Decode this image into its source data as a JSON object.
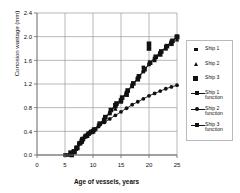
{
  "chart_data": {
    "type": "scatter",
    "title": "",
    "xlabel": "Age of vessels, years",
    "ylabel": "Corrosion wastage (mm)",
    "xlim": [
      0,
      25
    ],
    "ylim": [
      0.0,
      2.4
    ],
    "xticks": [
      "0",
      "5",
      "10",
      "15",
      "20",
      "25"
    ],
    "yticks": [
      "0.0",
      "0.4",
      "0.8",
      "1.2",
      "1.6",
      "2.0",
      "2.4"
    ],
    "grid": true,
    "legend_position": "right",
    "series": [
      {
        "name": "Ship 1",
        "marker": "diamond",
        "type": "scatter",
        "points": [
          [
            5.0,
            0.0
          ],
          [
            6.5,
            0.05
          ],
          [
            7.0,
            0.12
          ],
          [
            7.5,
            0.2
          ],
          [
            8.0,
            0.27
          ],
          [
            9.0,
            0.33
          ],
          [
            9.5,
            0.38
          ],
          [
            10.0,
            0.41
          ],
          [
            10.5,
            0.44
          ],
          [
            12.0,
            0.6
          ],
          [
            13.0,
            0.7
          ],
          [
            14.0,
            0.82
          ],
          [
            15.0,
            0.92
          ],
          [
            16.0,
            1.06
          ],
          [
            17.0,
            1.18
          ],
          [
            18.0,
            1.3
          ],
          [
            19.0,
            1.48
          ],
          [
            20.0,
            1.81
          ],
          [
            21.0,
            1.62
          ],
          [
            22.0,
            1.72
          ],
          [
            23.0,
            1.8
          ],
          [
            24.0,
            1.9
          ],
          [
            25.0,
            2.0
          ]
        ]
      },
      {
        "name": "Ship 2",
        "marker": "triangle",
        "type": "scatter",
        "points": [
          [
            6.0,
            0.02
          ],
          [
            7.0,
            0.1
          ],
          [
            8.0,
            0.22
          ],
          [
            9.0,
            0.32
          ],
          [
            10.0,
            0.4
          ],
          [
            12.0,
            0.56
          ],
          [
            14.0,
            0.78
          ],
          [
            15.0,
            0.9
          ],
          [
            17.0,
            1.16
          ],
          [
            19.0,
            1.44
          ],
          [
            21.0,
            1.6
          ],
          [
            23.0,
            1.8
          ],
          [
            25.0,
            1.95
          ]
        ]
      },
      {
        "name": "Ship 3",
        "marker": "square",
        "type": "scatter",
        "points": [
          [
            6.0,
            0.04
          ],
          [
            8.0,
            0.24
          ],
          [
            10.0,
            0.4
          ],
          [
            12.0,
            0.58
          ],
          [
            14.0,
            0.84
          ],
          [
            15.0,
            0.92
          ],
          [
            16.0,
            1.02
          ],
          [
            18.0,
            1.28
          ],
          [
            20.0,
            1.88
          ],
          [
            20.0,
            1.8
          ],
          [
            22.0,
            1.7
          ],
          [
            24.0,
            1.88
          ],
          [
            25.0,
            2.0
          ]
        ]
      },
      {
        "name": "Ship 1 function",
        "marker": "diamond-line",
        "type": "line",
        "points": [
          [
            5.5,
            0.0
          ],
          [
            6.0,
            0.03
          ],
          [
            6.5,
            0.07
          ],
          [
            7.0,
            0.13
          ],
          [
            7.5,
            0.19
          ],
          [
            8.0,
            0.25
          ],
          [
            8.5,
            0.3
          ],
          [
            9.0,
            0.34
          ],
          [
            9.5,
            0.38
          ],
          [
            10.0,
            0.41
          ],
          [
            11.0,
            0.5
          ],
          [
            12.0,
            0.6
          ],
          [
            13.0,
            0.71
          ],
          [
            14.0,
            0.82
          ],
          [
            15.0,
            0.93
          ],
          [
            16.0,
            1.05
          ],
          [
            17.0,
            1.17
          ],
          [
            18.0,
            1.29
          ],
          [
            19.0,
            1.41
          ],
          [
            20.0,
            1.53
          ],
          [
            21.0,
            1.63
          ],
          [
            22.0,
            1.73
          ],
          [
            23.0,
            1.83
          ],
          [
            24.0,
            1.92
          ],
          [
            25.0,
            2.0
          ]
        ]
      },
      {
        "name": "Ship 2 function",
        "marker": "cross-line",
        "type": "line",
        "points": [
          [
            6.0,
            0.0
          ],
          [
            6.5,
            0.05
          ],
          [
            7.0,
            0.11
          ],
          [
            7.5,
            0.18
          ],
          [
            8.0,
            0.25
          ],
          [
            8.5,
            0.31
          ],
          [
            9.0,
            0.35
          ],
          [
            9.5,
            0.38
          ],
          [
            10.0,
            0.41
          ],
          [
            11.0,
            0.48
          ],
          [
            12.0,
            0.55
          ],
          [
            13.0,
            0.61
          ],
          [
            14.0,
            0.67
          ],
          [
            15.0,
            0.73
          ],
          [
            16.0,
            0.79
          ],
          [
            17.0,
            0.85
          ],
          [
            18.0,
            0.9
          ],
          [
            19.0,
            0.95
          ],
          [
            20.0,
            1.0
          ],
          [
            21.0,
            1.04
          ],
          [
            22.0,
            1.08
          ],
          [
            23.0,
            1.12
          ],
          [
            24.0,
            1.15
          ],
          [
            25.0,
            1.18
          ]
        ]
      },
      {
        "name": "Ship 3 function",
        "marker": "square-line",
        "type": "line",
        "points": [
          [
            6.2,
            0.0
          ],
          [
            6.7,
            0.05
          ],
          [
            7.2,
            0.12
          ],
          [
            7.7,
            0.2
          ],
          [
            8.2,
            0.27
          ],
          [
            8.7,
            0.32
          ],
          [
            9.2,
            0.36
          ],
          [
            9.7,
            0.39
          ],
          [
            10.2,
            0.43
          ],
          [
            11.2,
            0.53
          ],
          [
            12.2,
            0.64
          ],
          [
            13.2,
            0.76
          ],
          [
            14.2,
            0.87
          ],
          [
            15.2,
            0.97
          ],
          [
            16.2,
            1.09
          ],
          [
            17.2,
            1.21
          ],
          [
            18.2,
            1.33
          ],
          [
            19.2,
            1.45
          ],
          [
            20.2,
            1.56
          ],
          [
            21.2,
            1.66
          ],
          [
            22.2,
            1.75
          ],
          [
            23.2,
            1.84
          ],
          [
            24.2,
            1.93
          ],
          [
            25.0,
            1.99
          ]
        ]
      }
    ]
  },
  "legend": {
    "items": [
      {
        "label": "Ship 1",
        "symbol": "diamond-marker"
      },
      {
        "label": "Ship 2",
        "symbol": "triangle-marker"
      },
      {
        "label": "Ship 3",
        "symbol": "square-marker"
      },
      {
        "label": "Ship 1 function",
        "symbol": "line-diamond"
      },
      {
        "label": "Ship 2 function",
        "symbol": "line-cross"
      },
      {
        "label": "Ship 3 function",
        "symbol": "line-square"
      }
    ]
  },
  "colors": {
    "series": "#111111",
    "grid": "#9a9a9a",
    "axis": "#666666",
    "legend_border": "#b9b9c4",
    "background": "#ffffff"
  }
}
